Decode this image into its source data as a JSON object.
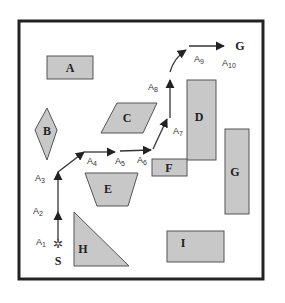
{
  "diagram": {
    "colors": {
      "obstacle_fill": "#c8c8c8",
      "obstacle_stroke": "#555555",
      "frame": "#222222",
      "path": "#333333"
    },
    "obstacles": [
      {
        "id": "A",
        "label": "A"
      },
      {
        "id": "B",
        "label": "B"
      },
      {
        "id": "C",
        "label": "C"
      },
      {
        "id": "D",
        "label": "D"
      },
      {
        "id": "E",
        "label": "E"
      },
      {
        "id": "F",
        "label": "F"
      },
      {
        "id": "G",
        "label": "G"
      },
      {
        "id": "H",
        "label": "H"
      },
      {
        "id": "I",
        "label": "I"
      }
    ],
    "start": {
      "label": "S",
      "icon": "star-burst-icon"
    },
    "goal": {
      "label": "G"
    },
    "steps": [
      {
        "label": "A",
        "sub": "1"
      },
      {
        "label": "A",
        "sub": "2"
      },
      {
        "label": "A",
        "sub": "3"
      },
      {
        "label": "A",
        "sub": "4"
      },
      {
        "label": "A",
        "sub": "5"
      },
      {
        "label": "A",
        "sub": "6"
      },
      {
        "label": "A",
        "sub": "7"
      },
      {
        "label": "A",
        "sub": "8"
      },
      {
        "label": "A",
        "sub": "9"
      },
      {
        "label": "A",
        "sub": "10"
      }
    ]
  }
}
